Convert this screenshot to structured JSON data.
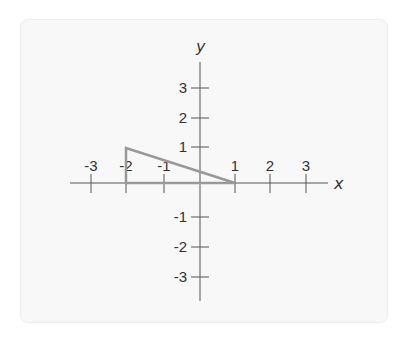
{
  "diagram": {
    "type": "coordinate-plane",
    "x_axis_label": "x",
    "y_axis_label": "y",
    "x_ticks": [
      {
        "value": -3,
        "label": "-3",
        "px": 91
      },
      {
        "value": -2,
        "label": "-2",
        "px": 126
      },
      {
        "value": -1,
        "label": "-1",
        "px": 164
      },
      {
        "value": 1,
        "label": "1",
        "px": 235
      },
      {
        "value": 2,
        "label": "2",
        "px": 270
      },
      {
        "value": 3,
        "label": "3",
        "px": 306
      }
    ],
    "y_ticks": [
      {
        "value": 3,
        "label": "3",
        "px": 88
      },
      {
        "value": 2,
        "label": "2",
        "px": 118
      },
      {
        "value": 1,
        "label": "1",
        "px": 147
      },
      {
        "value": -1,
        "label": "-1",
        "px": 217
      },
      {
        "value": -2,
        "label": "-2",
        "px": 247
      },
      {
        "value": -3,
        "label": "-3",
        "px": 277
      }
    ],
    "shape": {
      "type": "triangle",
      "vertices": [
        [
          -2,
          0
        ],
        [
          -2,
          1
        ],
        [
          1,
          0
        ]
      ],
      "stroke_color": "#999999"
    },
    "colors": {
      "axis": "#555555",
      "card_bg": "#f8f8f8",
      "text": "#333333"
    }
  }
}
